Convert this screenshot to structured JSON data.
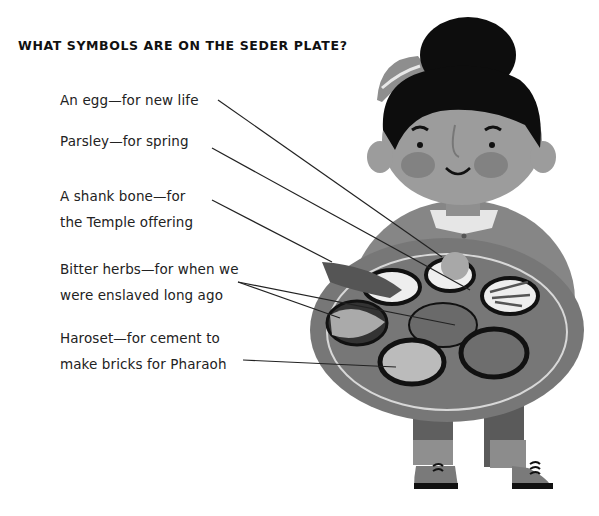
{
  "title": "WHAT SYMBOLS ARE ON THE SEDER PLATE?",
  "labels": [
    {
      "id": "egg",
      "lines": [
        "An egg—for new life"
      ]
    },
    {
      "id": "parsley",
      "lines": [
        "Parsley—for spring"
      ]
    },
    {
      "id": "shank-bone",
      "lines": [
        "A shank bone—for",
        "the Temple offering"
      ]
    },
    {
      "id": "bitter-herbs",
      "lines": [
        "Bitter herbs—for when we",
        "were enslaved long ago"
      ]
    },
    {
      "id": "haroset",
      "lines": [
        "Haroset—for cement to",
        "make bricks for Pharaoh"
      ]
    }
  ],
  "illustration": {
    "subject": "child holding seder plate",
    "colors": {
      "hair": "#0d0d0d",
      "skin": "#9a9a9a",
      "plate": "#7a7a7a",
      "shirt": "#858585",
      "collar": "#e8e8e8",
      "pants": "#6e6e6e",
      "shoes": "#7d7d7d"
    }
  }
}
